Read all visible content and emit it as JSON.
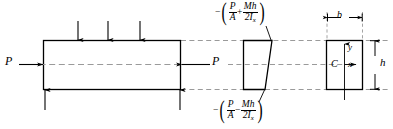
{
  "figure": {
    "colors": {
      "stroke": "#000000",
      "dashed": "#9a9a9a",
      "background": "#ffffff"
    }
  },
  "beam": {
    "name": "beam-elevation",
    "load_label_left": "P",
    "load_label_right": "P",
    "top_arrow_count": 3,
    "bottom_arrow_count": 2
  },
  "stress_diagram": {
    "name": "stress-distribution-trapezoid",
    "top_stress": {
      "sign": "−",
      "open_paren": "(",
      "close_paren": ")",
      "term1_num": "P",
      "term1_den": "A",
      "operator": "+",
      "term2_num": "Mh",
      "term2_den": "2I",
      "term2_den_sub": "x"
    },
    "bottom_stress": {
      "sign": "−",
      "open_paren": "(",
      "close_paren": ")",
      "term1_num": "P",
      "term1_den": "A",
      "operator": "−",
      "term2_num": "Mh",
      "term2_den": "2I",
      "term2_den_sub": "x"
    }
  },
  "cross_section": {
    "name": "rectangular-cross-section",
    "width_label": "b",
    "height_label": "h",
    "centroid_label": "C",
    "axis_x_label": "x",
    "axis_y_label": "y"
  }
}
